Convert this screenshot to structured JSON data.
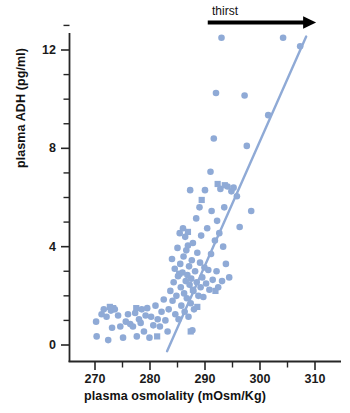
{
  "chart_data": {
    "type": "scatter",
    "title": "",
    "xlabel": "plasma osmolality (mOsm/Kg)",
    "ylabel": "plasma ADH (pg/ml)",
    "xlim": [
      265.5,
      312.0
    ],
    "ylim": [
      -1.2,
      13.2
    ],
    "grid": false,
    "legend": "none",
    "x_ticks_major": [
      270,
      280,
      290,
      300,
      310
    ],
    "x_tick_labels": [
      "270",
      "280",
      "290",
      "300",
      "310"
    ],
    "x_ticks_minor": [
      275,
      285,
      295,
      305
    ],
    "y_ticks_major": [
      0,
      4,
      8,
      12
    ],
    "y_tick_labels": [
      "0",
      "4",
      "8",
      "12"
    ],
    "y_ticks_minor": [
      1,
      2,
      3,
      5,
      6,
      7,
      9,
      10,
      11,
      13
    ],
    "marker_color": "#8FAAD6",
    "line_color": "#8FAAD6",
    "axis_color": "#262626",
    "annotations": [
      {
        "name": "thirst-arrow",
        "text": "thirst",
        "arrow": "right",
        "x_start": 290.5,
        "x_end": 310.2,
        "y": 13.0,
        "color": "#000000"
      }
    ],
    "trend_line": {
      "name": "regression-line",
      "x_start": 283.1,
      "y_start": -0.25,
      "x_end": 308.4,
      "y_end": 12.55,
      "width": 2.4
    },
    "series": [
      {
        "name": "circle-markers",
        "marker": "circle",
        "size": 6.6,
        "points": [
          [
            270.2,
            0.95
          ],
          [
            270.3,
            0.35
          ],
          [
            271.2,
            1.25
          ],
          [
            271.6,
            1.45
          ],
          [
            272.1,
            1.15
          ],
          [
            272.4,
            0.2
          ],
          [
            272.9,
            1.4
          ],
          [
            273.1,
            0.7
          ],
          [
            273.6,
            1.45
          ],
          [
            274.2,
            1.2
          ],
          [
            274.6,
            0.75
          ],
          [
            275.1,
            0.3
          ],
          [
            275.6,
            0.95
          ],
          [
            276.0,
            1.25
          ],
          [
            276.4,
            0.85
          ],
          [
            276.9,
            0.75
          ],
          [
            277.3,
            1.3
          ],
          [
            277.6,
            0.35
          ],
          [
            278.0,
            1.05
          ],
          [
            278.3,
            0.9
          ],
          [
            278.5,
            1.45
          ],
          [
            278.9,
            0.55
          ],
          [
            279.2,
            1.2
          ],
          [
            279.5,
            1.5
          ],
          [
            279.9,
            0.3
          ],
          [
            280.2,
            1.15
          ],
          [
            280.6,
            0.8
          ],
          [
            281.0,
            1.6
          ],
          [
            281.4,
            1.05
          ],
          [
            281.8,
            0.75
          ],
          [
            282.1,
            1.35
          ],
          [
            282.5,
            1.85
          ],
          [
            282.8,
            1.0
          ],
          [
            283.2,
            0.55
          ],
          [
            283.4,
            1.45
          ],
          [
            283.7,
            2.2
          ],
          [
            284.0,
            3.5
          ],
          [
            284.1,
            1.8
          ],
          [
            284.3,
            2.55
          ],
          [
            284.5,
            3.1
          ],
          [
            284.6,
            1.25
          ],
          [
            284.8,
            2.0
          ],
          [
            285.0,
            3.95
          ],
          [
            285.1,
            2.8
          ],
          [
            285.2,
            1.05
          ],
          [
            285.4,
            4.55
          ],
          [
            285.5,
            3.3
          ],
          [
            285.6,
            2.35
          ],
          [
            285.7,
            1.6
          ],
          [
            285.9,
            2.95
          ],
          [
            286.0,
            4.75
          ],
          [
            286.1,
            3.6
          ],
          [
            286.2,
            2.1
          ],
          [
            286.3,
            1.35
          ],
          [
            286.4,
            4.4
          ],
          [
            286.5,
            2.6
          ],
          [
            286.6,
            3.85
          ],
          [
            286.7,
            1.9
          ],
          [
            286.8,
            2.85
          ],
          [
            286.9,
            4.05
          ],
          [
            287.0,
            1.15
          ],
          [
            287.1,
            3.2
          ],
          [
            287.2,
            2.45
          ],
          [
            287.3,
            6.3
          ],
          [
            287.4,
            1.7
          ],
          [
            287.5,
            2.7
          ],
          [
            287.6,
            3.45
          ],
          [
            287.7,
            0.6
          ],
          [
            287.8,
            4.15
          ],
          [
            287.9,
            2.2
          ],
          [
            288.0,
            1.45
          ],
          [
            288.2,
            3.0
          ],
          [
            288.4,
            5.15
          ],
          [
            288.5,
            2.55
          ],
          [
            288.6,
            3.75
          ],
          [
            288.8,
            2.0
          ],
          [
            289.0,
            5.6
          ],
          [
            289.1,
            3.35
          ],
          [
            289.2,
            2.35
          ],
          [
            289.3,
            4.45
          ],
          [
            289.5,
            2.75
          ],
          [
            289.7,
            1.95
          ],
          [
            289.9,
            3.15
          ],
          [
            290.0,
            6.3
          ],
          [
            290.2,
            2.5
          ],
          [
            290.4,
            4.75
          ],
          [
            290.6,
            3.05
          ],
          [
            290.8,
            2.25
          ],
          [
            291.0,
            7.05
          ],
          [
            291.1,
            3.7
          ],
          [
            291.2,
            5.45
          ],
          [
            291.4,
            2.65
          ],
          [
            291.6,
            8.4
          ],
          [
            291.8,
            4.25
          ],
          [
            292.0,
            10.25
          ],
          [
            292.1,
            3.0
          ],
          [
            292.2,
            5.05
          ],
          [
            292.4,
            2.35
          ],
          [
            292.6,
            4.55
          ],
          [
            292.8,
            6.35
          ],
          [
            293.0,
            12.5
          ],
          [
            293.1,
            2.6
          ],
          [
            293.3,
            4.0
          ],
          [
            293.5,
            5.6
          ],
          [
            293.8,
            3.3
          ],
          [
            294.1,
            6.45
          ],
          [
            294.4,
            2.75
          ],
          [
            294.8,
            6.25
          ],
          [
            295.2,
            6.4
          ],
          [
            295.8,
            6.05
          ],
          [
            296.3,
            4.8
          ],
          [
            297.2,
            10.15
          ],
          [
            297.6,
            8.1
          ],
          [
            298.4,
            5.45
          ],
          [
            301.5,
            9.35
          ],
          [
            304.2,
            12.5
          ],
          [
            307.3,
            12.15
          ]
        ]
      },
      {
        "name": "square-markers",
        "marker": "square",
        "size": 6.2,
        "points": [
          [
            272.7,
            1.55
          ],
          [
            273.3,
            1.5
          ],
          [
            277.5,
            1.5
          ],
          [
            281.3,
            0.35
          ],
          [
            285.3,
            2.9
          ],
          [
            286.9,
            4.6
          ],
          [
            287.4,
            0.55
          ],
          [
            287.8,
            2.25
          ],
          [
            288.6,
            1.55
          ],
          [
            289.4,
            5.9
          ],
          [
            291.9,
            2.2
          ],
          [
            292.3,
            6.55
          ],
          [
            293.6,
            6.5
          ]
        ]
      }
    ]
  },
  "labels": {
    "x_axis_title": "plasma osmolality (mOsm/Kg)",
    "y_axis_title": "plasma ADH (pg/ml)",
    "thirst": "thirst"
  }
}
